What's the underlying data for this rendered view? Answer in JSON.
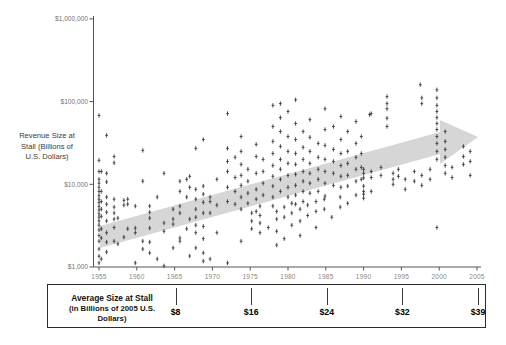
{
  "figure": {
    "y_axis_title_lines": [
      "Revenue Size at",
      "Stall (Billions of",
      "U.S. Dollars)"
    ],
    "box_title_line1": "Average Size at Stall",
    "box_title_line2": "(in Billions of 2005 U.S. Dollars)"
  },
  "colors": {
    "point": "#3a3a3a",
    "trend_arrow": "#d6d6d6",
    "axis": "#55554d",
    "year_label": "#8d887b",
    "money_label": "#74746b",
    "box_border": "#2b2b2b"
  },
  "chart_data": {
    "type": "scatter",
    "title": "",
    "xlabel": "Year",
    "ylabel": "Revenue Size at Stall (Billions of U.S. Dollars)",
    "y_scale": "log",
    "x_range": [
      1954,
      2006
    ],
    "y_range": [
      1000,
      1000000
    ],
    "grid": false,
    "x_ticks": [
      "1955",
      "1960",
      "1965",
      "1970",
      "1975",
      "1980",
      "1985",
      "1990",
      "1995",
      "2000",
      "2005"
    ],
    "x_tick_years": [
      1955,
      1960,
      1965,
      1970,
      1975,
      1980,
      1985,
      1990,
      1995,
      2000,
      2005
    ],
    "y_ticks": [
      {
        "value": 1000000,
        "label": "$1,000,000"
      },
      {
        "value": 100000,
        "label": "$100,000"
      },
      {
        "value": 10000,
        "label": "$10,000"
      },
      {
        "value": 1000,
        "label": "$1,000"
      }
    ],
    "trend_arrow": {
      "from_year": 1955,
      "from_value": 3000,
      "to_year": 2003,
      "to_value": 35000,
      "direction": "up-right"
    },
    "average_size_ticks": [
      {
        "year": 1965,
        "label": "$8"
      },
      {
        "year": 1975,
        "label": "$16"
      },
      {
        "year": 1985,
        "label": "$24"
      },
      {
        "year": 1995,
        "label": "$32"
      },
      {
        "year": 2005,
        "label": "$39"
      }
    ],
    "points": [
      [
        1955,
        68000
      ],
      [
        1955,
        19500
      ],
      [
        1955,
        14300
      ],
      [
        1955,
        11500
      ],
      [
        1955,
        10300
      ],
      [
        1955,
        9200
      ],
      [
        1955,
        8200
      ],
      [
        1955,
        7300
      ],
      [
        1955,
        6600
      ],
      [
        1955,
        6000
      ],
      [
        1955,
        5400
      ],
      [
        1955,
        4900
      ],
      [
        1955,
        4400
      ],
      [
        1955,
        4000
      ],
      [
        1955,
        3600
      ],
      [
        1955,
        3200
      ],
      [
        1955,
        2800
      ],
      [
        1955,
        2400
      ],
      [
        1955,
        2050
      ],
      [
        1955,
        1650
      ],
      [
        1955,
        1350
      ],
      [
        1955,
        1120
      ],
      [
        1955.3,
        14300
      ],
      [
        1955.3,
        8200
      ],
      [
        1955.3,
        6200
      ],
      [
        1955.3,
        5000
      ],
      [
        1955.3,
        4100
      ],
      [
        1955.3,
        2900
      ],
      [
        1955.3,
        2240
      ],
      [
        1955.3,
        1250
      ],
      [
        1956,
        39000
      ],
      [
        1956,
        13600
      ],
      [
        1956,
        10700
      ],
      [
        1956,
        7000
      ],
      [
        1956,
        5750
      ],
      [
        1956,
        4600
      ],
      [
        1956,
        3600
      ],
      [
        1956,
        2600
      ],
      [
        1956,
        2000
      ],
      [
        1956,
        1520
      ],
      [
        1957,
        21700
      ],
      [
        1957,
        18200
      ],
      [
        1957,
        6600
      ],
      [
        1957,
        5300
      ],
      [
        1957,
        4500
      ],
      [
        1957,
        3800
      ],
      [
        1957,
        3000
      ],
      [
        1957,
        2050
      ],
      [
        1957.5,
        3900
      ],
      [
        1957.5,
        1900
      ],
      [
        1958.3,
        6400
      ],
      [
        1958.3,
        5600
      ],
      [
        1958.3,
        2300
      ],
      [
        1958.8,
        6600
      ],
      [
        1958.8,
        5750
      ],
      [
        1958.8,
        2900
      ],
      [
        1959.8,
        5450
      ],
      [
        1959.8,
        2950
      ],
      [
        1959.8,
        2600
      ],
      [
        1959.8,
        1120
      ],
      [
        1960.8,
        25700
      ],
      [
        1960.8,
        10900
      ],
      [
        1960.8,
        2050
      ],
      [
        1960.8,
        1650
      ],
      [
        1961.7,
        5450
      ],
      [
        1961.7,
        4600
      ],
      [
        1961.7,
        3900
      ],
      [
        1961.7,
        2950
      ],
      [
        1961.7,
        2000
      ],
      [
        1961.7,
        1480
      ],
      [
        1962.7,
        7000
      ],
      [
        1962.7,
        1250
      ],
      [
        1963.6,
        13600
      ],
      [
        1963.6,
        3400
      ],
      [
        1963.6,
        2700
      ],
      [
        1963.6,
        1030
      ],
      [
        1964.8,
        5000
      ],
      [
        1964.8,
        3800
      ],
      [
        1964.8,
        3300
      ],
      [
        1964.8,
        1700
      ],
      [
        1965.7,
        10900
      ],
      [
        1965.7,
        8200
      ],
      [
        1965.7,
        5450
      ],
      [
        1965.7,
        4500
      ],
      [
        1965.7,
        2240
      ],
      [
        1965.7,
        2050
      ],
      [
        1966.6,
        11500
      ],
      [
        1966.6,
        7000
      ],
      [
        1966.6,
        2900
      ],
      [
        1967,
        12500
      ],
      [
        1967,
        9200
      ],
      [
        1967,
        3800
      ],
      [
        1967,
        1360
      ],
      [
        1967.8,
        27200
      ],
      [
        1967.8,
        8700
      ],
      [
        1967.8,
        6600
      ],
      [
        1967.8,
        5000
      ],
      [
        1967.8,
        4000
      ],
      [
        1967.8,
        3200
      ],
      [
        1967.8,
        2600
      ],
      [
        1967.8,
        1700
      ],
      [
        1968.8,
        34800
      ],
      [
        1968.8,
        9500
      ],
      [
        1968.8,
        7600
      ],
      [
        1968.8,
        6050
      ],
      [
        1968.8,
        4500
      ],
      [
        1968.8,
        3100
      ],
      [
        1968.8,
        2200
      ],
      [
        1968.8,
        1480
      ],
      [
        1968.8,
        1180
      ],
      [
        1969.7,
        7000
      ],
      [
        1969.7,
        6200
      ],
      [
        1969.7,
        4500
      ],
      [
        1969.7,
        1250
      ],
      [
        1970.6,
        11500
      ],
      [
        1970.6,
        5600
      ],
      [
        1970.6,
        2600
      ],
      [
        1972,
        71600
      ],
      [
        1972,
        27200
      ],
      [
        1972,
        18900
      ],
      [
        1972,
        14300
      ],
      [
        1972,
        9200
      ],
      [
        1972,
        6200
      ],
      [
        1972,
        1120
      ],
      [
        1973,
        21200
      ],
      [
        1973,
        12100
      ],
      [
        1973,
        8200
      ],
      [
        1973,
        5750
      ],
      [
        1973.8,
        37800
      ],
      [
        1973.8,
        25000
      ],
      [
        1973.8,
        17400
      ],
      [
        1973.8,
        12800
      ],
      [
        1973.8,
        9700
      ],
      [
        1973.8,
        7000
      ],
      [
        1973.8,
        5000
      ],
      [
        1973.8,
        2050
      ],
      [
        1974.7,
        15200
      ],
      [
        1974.7,
        10900
      ],
      [
        1974.7,
        7800
      ],
      [
        1974.7,
        5900
      ],
      [
        1975.2,
        4500
      ],
      [
        1975.2,
        3600
      ],
      [
        1975.2,
        2900
      ],
      [
        1975.8,
        30400
      ],
      [
        1975.8,
        21700
      ],
      [
        1975.8,
        13600
      ],
      [
        1975.8,
        8700
      ],
      [
        1975.8,
        6600
      ],
      [
        1975.8,
        4700
      ],
      [
        1976.3,
        5450
      ],
      [
        1976.3,
        4200
      ],
      [
        1976.3,
        3400
      ],
      [
        1976.3,
        2600
      ],
      [
        1976.7,
        20000
      ],
      [
        1976.7,
        14300
      ],
      [
        1976.7,
        10300
      ],
      [
        1976.7,
        7400
      ],
      [
        1977.4,
        3000
      ],
      [
        1978,
        90000
      ],
      [
        1978,
        50000
      ],
      [
        1978,
        33000
      ],
      [
        1978,
        23600
      ],
      [
        1978,
        16900
      ],
      [
        1978,
        12500
      ],
      [
        1978,
        9500
      ],
      [
        1978,
        7000
      ],
      [
        1978,
        5450
      ],
      [
        1978.5,
        4700
      ],
      [
        1978.5,
        3800
      ],
      [
        1978.5,
        2700
      ],
      [
        1978.5,
        1840
      ],
      [
        1979,
        94600
      ],
      [
        1979,
        64000
      ],
      [
        1979,
        43500
      ],
      [
        1979,
        28700
      ],
      [
        1979,
        20000
      ],
      [
        1979,
        15200
      ],
      [
        1979,
        11500
      ],
      [
        1979,
        8200
      ],
      [
        1979.5,
        5300
      ],
      [
        1979.5,
        4000
      ],
      [
        1979.5,
        2200
      ],
      [
        1980,
        75900
      ],
      [
        1980,
        37800
      ],
      [
        1980,
        25000
      ],
      [
        1980,
        17900
      ],
      [
        1980,
        12800
      ],
      [
        1980,
        9200
      ],
      [
        1980,
        7000
      ],
      [
        1980.5,
        5900
      ],
      [
        1980.5,
        4500
      ],
      [
        1980.5,
        3200
      ],
      [
        1981,
        105000
      ],
      [
        1981,
        54300
      ],
      [
        1981,
        34800
      ],
      [
        1981,
        23600
      ],
      [
        1981,
        17400
      ],
      [
        1981,
        13200
      ],
      [
        1981,
        9700
      ],
      [
        1981,
        7400
      ],
      [
        1981,
        5750
      ],
      [
        1981.6,
        5000
      ],
      [
        1981.6,
        3600
      ],
      [
        1981.6,
        2400
      ],
      [
        1982,
        43500
      ],
      [
        1982,
        28000
      ],
      [
        1982,
        20000
      ],
      [
        1982,
        14300
      ],
      [
        1982,
        10900
      ],
      [
        1982,
        8200
      ],
      [
        1982,
        6200
      ],
      [
        1982.6,
        5600
      ],
      [
        1982.6,
        4200
      ],
      [
        1982.9,
        60600
      ],
      [
        1982.9,
        37000
      ],
      [
        1982.9,
        25000
      ],
      [
        1982.9,
        17900
      ],
      [
        1982.9,
        13600
      ],
      [
        1982.9,
        10300
      ],
      [
        1982.9,
        7800
      ],
      [
        1983.7,
        6200
      ],
      [
        1983.7,
        4700
      ],
      [
        1983.7,
        3000
      ],
      [
        1984,
        31200
      ],
      [
        1984,
        21200
      ],
      [
        1984,
        15200
      ],
      [
        1984,
        11500
      ],
      [
        1984,
        8200
      ],
      [
        1984.8,
        6600
      ],
      [
        1984.8,
        5000
      ],
      [
        1984.9,
        82000
      ],
      [
        1984.9,
        46000
      ],
      [
        1984.9,
        29500
      ],
      [
        1984.9,
        20000
      ],
      [
        1984.9,
        14300
      ],
      [
        1984.9,
        10300
      ],
      [
        1984.9,
        7200
      ],
      [
        1985.8,
        4000
      ],
      [
        1986,
        50000
      ],
      [
        1986,
        26400
      ],
      [
        1986,
        18900
      ],
      [
        1986,
        13600
      ],
      [
        1986,
        9700
      ],
      [
        1986.9,
        7000
      ],
      [
        1986.9,
        5300
      ],
      [
        1987,
        66000
      ],
      [
        1987,
        34800
      ],
      [
        1987,
        23600
      ],
      [
        1987,
        16900
      ],
      [
        1987,
        12500
      ],
      [
        1987,
        9200
      ],
      [
        1987.9,
        43500
      ],
      [
        1987.9,
        25000
      ],
      [
        1987.9,
        17900
      ],
      [
        1987.9,
        12800
      ],
      [
        1987.9,
        9500
      ],
      [
        1987.9,
        5900
      ],
      [
        1989,
        57400
      ],
      [
        1989,
        31200
      ],
      [
        1989,
        21200
      ],
      [
        1989,
        15200
      ],
      [
        1989,
        10900
      ],
      [
        1989,
        7400
      ],
      [
        1989.7,
        37800
      ],
      [
        1989.7,
        23600
      ],
      [
        1989.7,
        16000
      ],
      [
        1989.7,
        11500
      ],
      [
        1990,
        15200
      ],
      [
        1990,
        13600
      ],
      [
        1990,
        12000
      ],
      [
        1990,
        9500
      ],
      [
        1990,
        8200
      ],
      [
        1990,
        7600
      ],
      [
        1990,
        6800
      ],
      [
        1990.8,
        69700
      ],
      [
        1991,
        71600
      ],
      [
        1991,
        14300
      ],
      [
        1991,
        12100
      ],
      [
        1991,
        8200
      ],
      [
        1992.3,
        16000
      ],
      [
        1992.3,
        12800
      ],
      [
        1993.1,
        115000
      ],
      [
        1993.1,
        94600
      ],
      [
        1993.1,
        82000
      ],
      [
        1993.1,
        63000
      ],
      [
        1993.1,
        50000
      ],
      [
        1993.9,
        13600
      ],
      [
        1993.9,
        11500
      ],
      [
        1993.9,
        10000
      ],
      [
        1994.6,
        15200
      ],
      [
        1994.6,
        12500
      ],
      [
        1995.5,
        11500
      ],
      [
        1995.5,
        8700
      ],
      [
        1996.7,
        14300
      ],
      [
        1996.7,
        10900
      ],
      [
        1997.5,
        160000
      ],
      [
        1997.7,
        111000
      ],
      [
        1997.7,
        94600
      ],
      [
        1997.7,
        12800
      ],
      [
        1997.7,
        9700
      ],
      [
        1998.8,
        15200
      ],
      [
        1998.8,
        11500
      ],
      [
        1999.7,
        139000
      ],
      [
        1999.7,
        111000
      ],
      [
        1999.7,
        90000
      ],
      [
        1999.7,
        75900
      ],
      [
        1999.7,
        64000
      ],
      [
        1999.7,
        54300
      ],
      [
        1999.7,
        46000
      ],
      [
        1999.7,
        37800
      ],
      [
        1999.7,
        31200
      ],
      [
        1999.7,
        25000
      ],
      [
        1999.7,
        20000
      ],
      [
        1999.7,
        3000
      ],
      [
        2000.8,
        43500
      ],
      [
        2000.8,
        33000
      ],
      [
        2000.8,
        26400
      ],
      [
        2000.8,
        21200
      ],
      [
        2000.8,
        16900
      ],
      [
        2000.8,
        13600
      ],
      [
        2001.7,
        16000
      ],
      [
        2001.7,
        12100
      ],
      [
        2003.2,
        28700
      ],
      [
        2003.2,
        21700
      ],
      [
        2003.2,
        17400
      ],
      [
        2004.1,
        25000
      ],
      [
        2004.1,
        18900
      ],
      [
        2004.1,
        12800
      ]
    ]
  }
}
